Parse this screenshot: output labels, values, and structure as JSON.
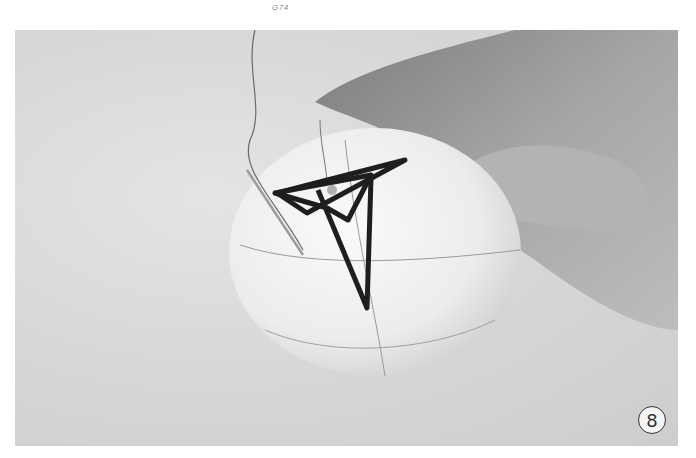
{
  "page": {
    "header_label": "G74"
  },
  "photo": {
    "description": "Hand holding a white temari ball wrapped in thread, with dark thread stitched in an overlapping triangular pattern on top and a needle inserted",
    "step_number": "8"
  },
  "colors": {
    "background": "#cfcfcf",
    "ball": "#f2f2f2",
    "thread": "#1e1e1e",
    "hand": "#9a9a9a"
  }
}
